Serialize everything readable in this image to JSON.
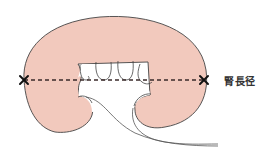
{
  "diagram": {
    "label": "腎長径",
    "measurement": {
      "name": "renal length",
      "endpoints": [
        {
          "marker": "x-mark",
          "x": 24,
          "y": 80
        },
        {
          "marker": "x-mark",
          "x": 204,
          "y": 80
        }
      ],
      "line_style": "dashed"
    },
    "colors": {
      "kidney_fill": "#f2c9bd",
      "outline": "#444444",
      "dashed_line": "#3a2a2a",
      "marker": "#111111",
      "label": "#333333",
      "background": "#ffffff"
    }
  }
}
